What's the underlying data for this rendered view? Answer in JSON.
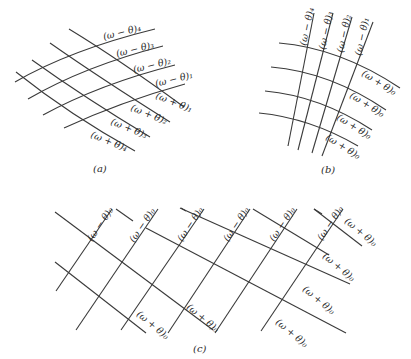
{
  "figure": {
    "panels": [
      {
        "id": "a",
        "caption": "(a)",
        "minus_labels": [
          "(ω − θ)₄",
          "(ω − θ)₃",
          "(ω − θ)₂",
          "(ω − θ)₁"
        ],
        "plus_labels": [
          "(ω + θ)₁",
          "(ω + θ)₂",
          "(ω + θ)₃",
          "(ω + θ)₄"
        ]
      },
      {
        "id": "b",
        "caption": "(b)",
        "minus_labels": [
          "(ω − θ)₄",
          "(ω − θ)₃",
          "(ω − θ)₂",
          "(ω − θ)₁"
        ],
        "plus_labels": [
          "(ω + θ)₀",
          "(ω + θ)₀",
          "(ω + θ)₀",
          "(ω + θ)₀"
        ]
      },
      {
        "id": "c",
        "caption": "(c)",
        "minus_labels": [
          "(ω − θ)₀",
          "(ω − θ)₀",
          "(ω − θ)₀",
          "(ω − θ)₀",
          "(ω − θ)₀",
          "(ω − θ)₀"
        ],
        "plus_labels": [
          "(ω + θ)₀",
          "(ω + θ)₀",
          "(ω + θ)₀",
          "(ω + θ)₀",
          "(ω + θ)₀",
          "(ω + θ)₀"
        ]
      }
    ]
  }
}
